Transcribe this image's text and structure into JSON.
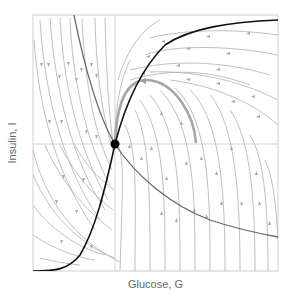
{
  "figure": {
    "type": "phase-plane",
    "xlabel": "Glucose, G",
    "ylabel": "Insulin, I"
  },
  "colors": {
    "frame": "#cccccc",
    "gridline": "#c8c8c8",
    "streamline": "#aaaaaa",
    "glucose_nullcline": "#111111",
    "insulin_nullcline": "#666666",
    "trajectory": "#a6a6a6",
    "fixed_point": "#000000"
  },
  "elements": {
    "fixed_point": {
      "label": "steady state",
      "x": 115,
      "y": 144
    },
    "nullcline_dark": "black nullcline rising from lower-left through fixed point to upper-right",
    "nullcline_gray": "gray nullcline falling from top-left through fixed point to lower-right",
    "trajectory": "highlighted trajectory arcing up-left and returning to steady state"
  }
}
